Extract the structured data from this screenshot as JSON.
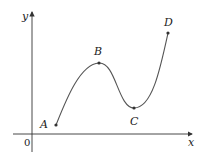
{
  "diagram": {
    "axes": {
      "x_label": "x",
      "y_label": "y",
      "origin_label": "0",
      "color": "#333333"
    },
    "curve": {
      "color": "#555555",
      "description": "smooth curve rising from A to local maximum B, falling to local minimum C, then rising steeply to D"
    },
    "points": [
      {
        "label": "A",
        "x": 56,
        "y": 125
      },
      {
        "label": "B",
        "x": 99,
        "y": 63
      },
      {
        "label": "C",
        "x": 134,
        "y": 108
      },
      {
        "label": "D",
        "x": 168,
        "y": 33
      }
    ]
  }
}
